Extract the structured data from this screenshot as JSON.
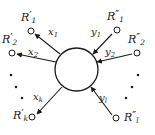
{
  "figure": {
    "type": "node-edge-diagram",
    "background_color": "#ffffff",
    "stroke_color": "#1a1a1a",
    "center_node": {
      "name": "central-node",
      "shape": "circle",
      "cx": 76.5,
      "cy": 69.5,
      "r": 21.5,
      "fill": "#ffffff",
      "stroke": "#1a1a1a"
    },
    "left_nodes": [
      {
        "id": "R1p",
        "base": "R",
        "prime": "′",
        "sub": "1",
        "cx": 31,
        "cy": 31,
        "label_x": 21,
        "label_y": 10
      },
      {
        "id": "R2p",
        "base": "R",
        "prime": "′",
        "sub": "2",
        "cx": 12,
        "cy": 53,
        "label_x": 2,
        "label_y": 32
      },
      {
        "id": "Rkp",
        "base": "R",
        "prime": "′",
        "sub": "k",
        "cx": 32,
        "cy": 117,
        "label_x": 13,
        "label_y": 108
      }
    ],
    "right_nodes": [
      {
        "id": "R1pp",
        "base": "R",
        "prime": "″",
        "sub": "1",
        "cx": 117,
        "cy": 30,
        "label_x": 107,
        "label_y": 9
      },
      {
        "id": "R2pp",
        "base": "R",
        "prime": "″",
        "sub": "2",
        "cx": 137,
        "cy": 53,
        "label_x": 128,
        "label_y": 32
      },
      {
        "id": "Rlpp",
        "base": "R",
        "prime": "″",
        "sub": "l",
        "cx": 116,
        "cy": 118,
        "label_x": 124,
        "label_y": 110
      }
    ],
    "left_edges": [
      {
        "id": "x1",
        "base": "x",
        "sub": "1",
        "label_x": 48,
        "label_y": 27,
        "from_x": 60,
        "from_y": 54,
        "to_x": 35,
        "to_y": 34,
        "arrow_at": "node"
      },
      {
        "id": "x2",
        "base": "x",
        "sub": "2",
        "label_x": 28,
        "label_y": 47,
        "from_x": 56,
        "from_y": 62,
        "to_x": 17,
        "to_y": 54,
        "arrow_at": "node"
      },
      {
        "id": "xk",
        "base": "x",
        "sub": "k",
        "label_x": 33,
        "label_y": 92,
        "from_x": 62,
        "from_y": 87,
        "to_x": 37,
        "to_y": 114,
        "arrow_at": "node"
      }
    ],
    "right_edges": [
      {
        "id": "y1",
        "base": "y",
        "sub": "1",
        "label_x": 91,
        "label_y": 27,
        "from_x": 112,
        "from_y": 34,
        "to_x": 93,
        "to_y": 54,
        "arrow_at": "center"
      },
      {
        "id": "y2",
        "base": "y",
        "sub": "2",
        "label_x": 105,
        "label_y": 47,
        "from_x": 132,
        "from_y": 54,
        "to_x": 97,
        "to_y": 62,
        "arrow_at": "center"
      },
      {
        "id": "yl",
        "base": "y",
        "sub": "l",
        "label_x": 99,
        "label_y": 93,
        "from_x": 112,
        "from_y": 115,
        "to_x": 91,
        "to_y": 87,
        "arrow_at": "center"
      }
    ],
    "left_ellipsis": [
      {
        "cx": 11,
        "cy": 75
      },
      {
        "cx": 16,
        "cy": 87
      },
      {
        "cx": 22,
        "cy": 98
      }
    ],
    "right_ellipsis": [
      {
        "cx": 138,
        "cy": 75
      },
      {
        "cx": 132,
        "cy": 87
      },
      {
        "cx": 126,
        "cy": 98
      }
    ],
    "vertex_marker": {
      "r": 3,
      "fill": "#ffffff",
      "stroke": "#1a1a1a"
    },
    "ellipsis_dot": {
      "size": 2.2,
      "fill": "#1a1a1a"
    }
  }
}
